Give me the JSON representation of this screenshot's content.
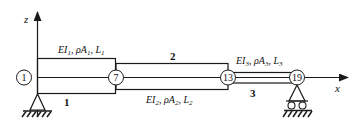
{
  "diagram": {
    "type": "beam-structure",
    "axes": {
      "vertical": {
        "label": "z"
      },
      "horizontal": {
        "label": "x"
      }
    },
    "segments": [
      {
        "id": "1",
        "label": "1",
        "properties": "EI1, ρA1, L1",
        "props_parts": {
          "e": "EI",
          "s1": "1",
          "rho": ", ρA",
          "s2": "1",
          "l": ", L",
          "s3": "1"
        }
      },
      {
        "id": "2",
        "label": "2",
        "properties": "EI2, ρA2, L2",
        "props_parts": {
          "e": "EI",
          "s1": "2",
          "rho": ", ρA",
          "s2": "2",
          "l": ", L",
          "s3": "2"
        }
      },
      {
        "id": "3",
        "label": "3",
        "properties": "EI3, ρA3, L3",
        "props_parts": {
          "e": "EI",
          "s1": "3",
          "rho": ", ρA",
          "s2": "3",
          "l": ", L",
          "s3": "3"
        }
      }
    ],
    "nodes": [
      {
        "label": "1"
      },
      {
        "label": "7"
      },
      {
        "label": "13"
      },
      {
        "label": "19"
      }
    ],
    "supports": [
      {
        "type": "pin",
        "at_node": "1"
      },
      {
        "type": "roller",
        "at_node": "19"
      }
    ],
    "colors": {
      "stroke": "#1a1a1a",
      "background": "#ffffff"
    }
  }
}
